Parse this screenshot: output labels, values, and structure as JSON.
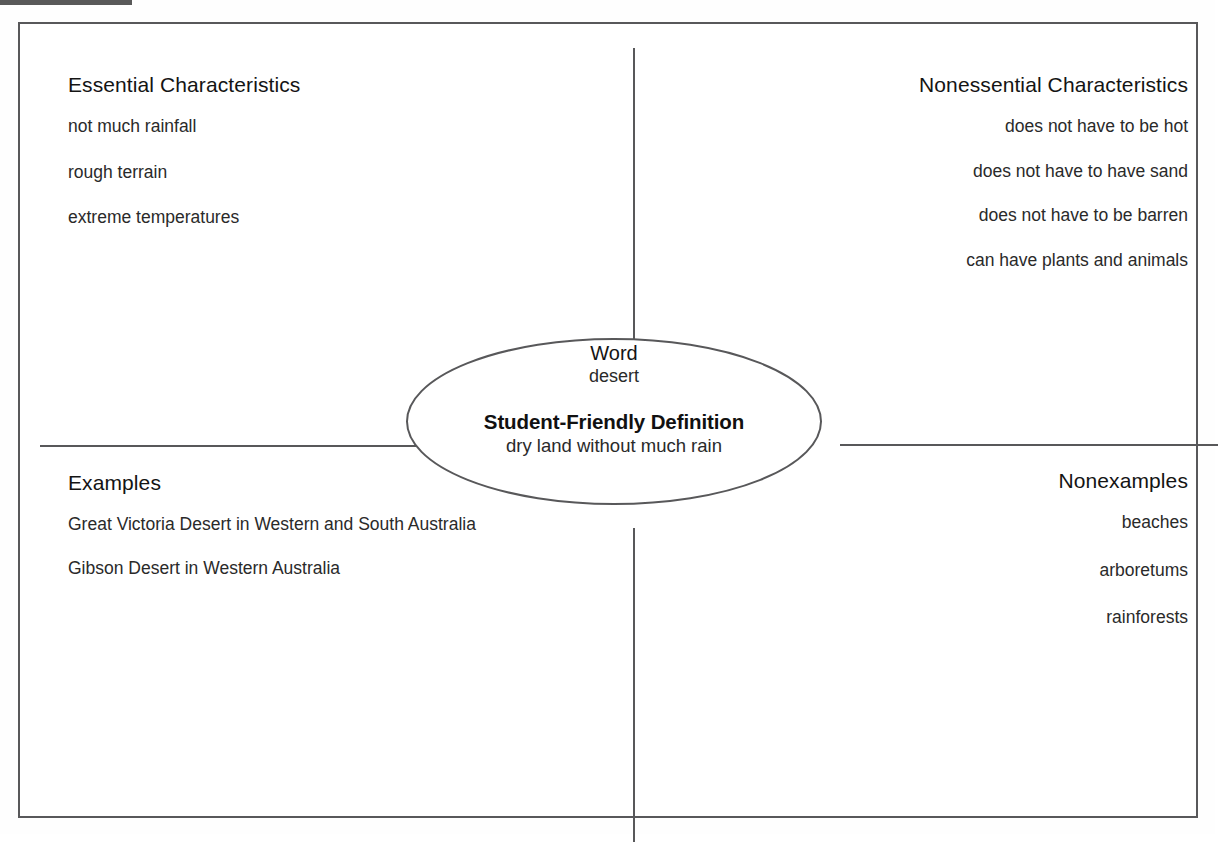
{
  "diagram": {
    "type": "frayer-model",
    "center": {
      "word_label": "Word",
      "word_value": "desert",
      "definition_label": "Student-Friendly Definition",
      "definition_value": "dry land without much rain"
    },
    "quadrants": {
      "top_left": {
        "title": "Essential Characteristics",
        "align": "left",
        "items": [
          "not much rainfall",
          "rough terrain",
          "extreme temperatures"
        ]
      },
      "top_right": {
        "title": "Nonessential Characteristics",
        "align": "right",
        "items": [
          "does not have to be hot",
          "does not have to have sand",
          "does not have to be barren",
          "can have plants and animals"
        ]
      },
      "bottom_left": {
        "title": "Examples",
        "align": "left",
        "items": [
          "Great Victoria Desert in Western and South Australia",
          "Gibson Desert in Western Australia"
        ]
      },
      "bottom_right": {
        "title": "Nonexamples",
        "align": "right",
        "items": [
          "beaches",
          "arboretums",
          "rainforests"
        ]
      }
    }
  },
  "colors": {
    "line": "#58585a",
    "text": "#1a1a1a",
    "background": "#ffffff"
  }
}
